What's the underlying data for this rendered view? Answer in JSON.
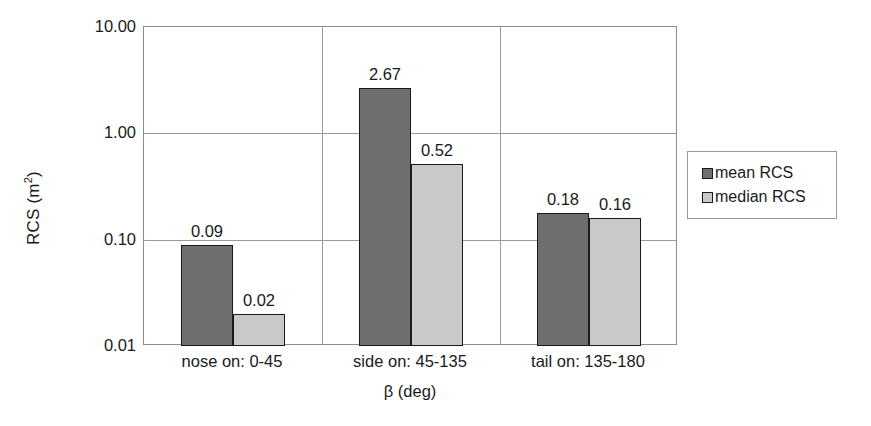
{
  "chart_data": {
    "type": "bar",
    "title": "",
    "subtitle": "",
    "xlabel": "β (deg)",
    "ylabel": "RCS (m²)",
    "ylabel_base": "RCS (m",
    "ylabel_sup": "2",
    "ylabel_tail": ")",
    "yscale": "log",
    "ylim": [
      0.01,
      10.0
    ],
    "ytick_labels": [
      "10.00",
      "1.00",
      "0.10",
      "0.01"
    ],
    "ytick_values": [
      10.0,
      1.0,
      0.1,
      0.01
    ],
    "grid": true,
    "grid_axis": "y",
    "legend_position": "right-outside",
    "categories": [
      "nose on:  0-45",
      "side on: 45-135",
      "tail on: 135-180"
    ],
    "series": [
      {
        "name": "mean RCS",
        "color": "#6e6e6e",
        "values": [
          0.09,
          2.67,
          0.18
        ],
        "labels": [
          "0.09",
          "2.67",
          "0.18"
        ]
      },
      {
        "name": "median RCS",
        "color": "#c9c9c9",
        "values": [
          0.02,
          0.52,
          0.16
        ],
        "labels": [
          "0.02",
          "0.52",
          "0.16"
        ]
      }
    ]
  },
  "legend": {
    "entries": [
      {
        "label": "mean RCS",
        "color": "#6e6e6e"
      },
      {
        "label": "median RCS",
        "color": "#c9c9c9"
      }
    ]
  },
  "colors": {
    "mean": "#6e6e6e",
    "median": "#c9c9c9",
    "axis": "#8d8d8d",
    "grid": "#9a9a9a",
    "text": "#1a1a1a",
    "background": "#ffffff"
  }
}
